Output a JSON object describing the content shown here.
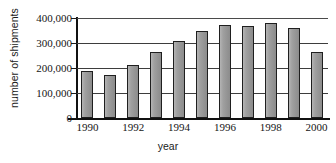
{
  "chart_data": {
    "type": "bar",
    "title": "",
    "xlabel": "year",
    "ylabel": "number of shipments",
    "categories": [
      "1990",
      "1991",
      "1992",
      "1993",
      "1994",
      "1995",
      "1996",
      "1997",
      "1998",
      "1999",
      "2000"
    ],
    "values": [
      190000,
      172000,
      213000,
      265000,
      310000,
      348000,
      372000,
      367000,
      382000,
      361000,
      263000
    ],
    "ylim": [
      0,
      400000
    ],
    "ytick_values": [
      0,
      100000,
      200000,
      300000,
      400000
    ],
    "ytick_labels": [
      "0",
      "100,000",
      "200,000",
      "300,000",
      "400,000"
    ],
    "xtick_labels": [
      "1990",
      "1992",
      "1994",
      "1996",
      "1998",
      "2000"
    ],
    "grid": "horizontal",
    "legend": "none",
    "bar_fill_color": "#9a9a9a",
    "bar_edge_color": "#1f1f1f",
    "axis_color": "#111111",
    "gridline_color": "#3d3d3d",
    "background_color": "#ffffff"
  }
}
